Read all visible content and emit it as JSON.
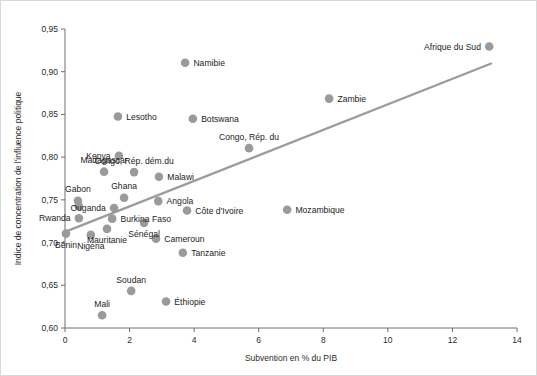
{
  "chart_data": {
    "type": "scatter",
    "title": "",
    "subtitle": "",
    "xlabel": "Subvention en % du PIB",
    "ylabel": "Indice de concentration de l'influence politique",
    "xlim": [
      0,
      14
    ],
    "ylim": [
      0.6,
      0.95
    ],
    "xticks": [
      "0",
      "2",
      "4",
      "6",
      "8",
      "10",
      "12",
      "14"
    ],
    "xtick_values": [
      0,
      2,
      4,
      6,
      8,
      10,
      12,
      14
    ],
    "yticks": [
      "0,60",
      "0,65",
      "0,70",
      "0,75",
      "0,80",
      "0,85",
      "0,90",
      "0,95"
    ],
    "ytick_values": [
      0.6,
      0.65,
      0.7,
      0.75,
      0.8,
      0.85,
      0.9,
      0.95
    ],
    "grid": false,
    "legend": "none",
    "marker_color": "#9a9a9a",
    "trendline_color": "#9b9b9b",
    "axis_color": "#6e6e6e",
    "trendline": {
      "x_start": 0.0,
      "y_start": 0.7125,
      "x_end": 13.2,
      "y_end": 0.9095
    },
    "points": [
      {
        "label": "Namibie",
        "x": 3.72,
        "y": 0.9105,
        "label_pos": "right"
      },
      {
        "label": "Afrique du Sud",
        "x": 13.14,
        "y": 0.9295,
        "label_pos": "left"
      },
      {
        "label": "Zambie",
        "x": 8.18,
        "y": 0.8685,
        "label_pos": "right"
      },
      {
        "label": "Lesotho",
        "x": 1.64,
        "y": 0.8475,
        "label_pos": "right"
      },
      {
        "label": "Botswana",
        "x": 3.96,
        "y": 0.845,
        "label_pos": "right"
      },
      {
        "label": "Congo, Rép. du",
        "x": 5.7,
        "y": 0.8105,
        "label_pos": "above"
      },
      {
        "label": "Kenya",
        "x": 1.67,
        "y": 0.8015,
        "label_pos": "left"
      },
      {
        "label": "Congo, Rép. dém.du",
        "x": 2.14,
        "y": 0.7825,
        "label_pos": "above"
      },
      {
        "label": "Madagascar",
        "x": 1.21,
        "y": 0.783,
        "label_pos": "above"
      },
      {
        "label": "Malawi",
        "x": 2.91,
        "y": 0.777,
        "label_pos": "right"
      },
      {
        "label": "Gabon",
        "x": 0.4,
        "y": 0.749,
        "label_pos": "above"
      },
      {
        "label": "Gabon2",
        "x": 0.43,
        "y": 0.7425,
        "label_pos": "none"
      },
      {
        "label": "Ghana",
        "x": 1.83,
        "y": 0.7525,
        "label_pos": "above"
      },
      {
        "label": "Ouganda",
        "x": 1.52,
        "y": 0.7405,
        "label_pos": "left"
      },
      {
        "label": "Angola",
        "x": 2.89,
        "y": 0.7485,
        "label_pos": "right"
      },
      {
        "label": "Côte d'Ivoire",
        "x": 3.78,
        "y": 0.7375,
        "label_pos": "right"
      },
      {
        "label": "Mozambique",
        "x": 6.88,
        "y": 0.7385,
        "label_pos": "right"
      },
      {
        "label": "Rwanda",
        "x": 0.43,
        "y": 0.7285,
        "label_pos": "left"
      },
      {
        "label": "Burkina Faso",
        "x": 1.46,
        "y": 0.728,
        "label_pos": "right"
      },
      {
        "label": "Sénégal",
        "x": 2.45,
        "y": 0.723,
        "label_pos": "below"
      },
      {
        "label": "Mauritanie",
        "x": 1.3,
        "y": 0.716,
        "label_pos": "below"
      },
      {
        "label": "Nigéria",
        "x": 0.8,
        "y": 0.709,
        "label_pos": "below"
      },
      {
        "label": "Bénin",
        "x": 0.03,
        "y": 0.7105,
        "label_pos": "below"
      },
      {
        "label": "Cameroun",
        "x": 2.82,
        "y": 0.7045,
        "label_pos": "right"
      },
      {
        "label": "Tanzanie",
        "x": 3.65,
        "y": 0.688,
        "label_pos": "right"
      },
      {
        "label": "Soudan",
        "x": 2.05,
        "y": 0.6435,
        "label_pos": "above"
      },
      {
        "label": "Éthiopie",
        "x": 3.13,
        "y": 0.631,
        "label_pos": "right"
      },
      {
        "label": "Mali",
        "x": 1.15,
        "y": 0.615,
        "label_pos": "above"
      }
    ]
  },
  "geometry": {
    "plot_left_px": 64,
    "plot_right_px": 516,
    "plot_top_px": 28,
    "plot_bottom_px": 327,
    "dot_radius_px": 4.3
  },
  "labels": {
    "y_axis_title": "Indice de concentration de l'influence politique",
    "x_axis_title": "Subvention en % du PIB"
  }
}
